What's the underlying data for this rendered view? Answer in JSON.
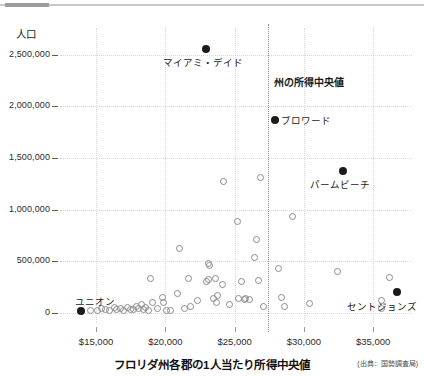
{
  "figure": {
    "y_axis_title": "人口",
    "x_axis_title": "フロリダ州各郡の1人当たり所得中央値",
    "source_note": "(出典：国勢調査局)"
  },
  "annotations": {
    "miami_dade": "マイアミ・デイド",
    "state_median": "州の所得中央値",
    "broward": "ブロワード",
    "palm_beach": "パームビーチ",
    "union": "ユニオン",
    "st_johns": "セントジョンズ"
  },
  "chart_data": {
    "type": "scatter",
    "title": "",
    "xlabel": "フロリダ州各郡の1人当たり所得中央値",
    "ylabel": "人口",
    "xlim": [
      12400,
      37800
    ],
    "ylim": [
      -90000,
      2760000
    ],
    "xticks": [
      15000,
      20000,
      25000,
      30000,
      35000
    ],
    "xticklabels": [
      "$15,000",
      "$20,000",
      "$25,000",
      "$30,000",
      "$35,000"
    ],
    "yticks": [
      0,
      500000,
      1000000,
      1500000,
      2000000,
      2500000
    ],
    "yticklabels": [
      "0",
      "500,000",
      "1,000,000",
      "1,500,000",
      "2,000,000",
      "2,500,000"
    ],
    "grid": true,
    "legend": "none",
    "reference_line": {
      "orientation": "vertical",
      "value": 27400,
      "label": "州の所得中央値",
      "style": "dotted"
    },
    "series": [
      {
        "name": "highlighted-counties",
        "marker": "filled-circle",
        "color": "#1a1a1a",
        "points": [
          {
            "label": "マイアミ・デイド",
            "x": 22900,
            "y": 2560000
          },
          {
            "label": "ブロワード",
            "x": 27900,
            "y": 1870000
          },
          {
            "label": "パームビーチ",
            "x": 32800,
            "y": 1370000
          },
          {
            "label": "セントジョンズ",
            "x": 36700,
            "y": 200000
          },
          {
            "label": "ユニオン",
            "x": 13900,
            "y": 15000
          }
        ]
      },
      {
        "name": "other-counties",
        "marker": "open-circle",
        "color": "#8d8d8d",
        "points": [
          {
            "x": 14600,
            "y": 20000
          },
          {
            "x": 15100,
            "y": 25000
          },
          {
            "x": 15400,
            "y": 45000
          },
          {
            "x": 15700,
            "y": 30000
          },
          {
            "x": 16000,
            "y": 20000
          },
          {
            "x": 16300,
            "y": 50000
          },
          {
            "x": 16500,
            "y": 28000
          },
          {
            "x": 16800,
            "y": 45000
          },
          {
            "x": 17000,
            "y": 22000
          },
          {
            "x": 17300,
            "y": 55000
          },
          {
            "x": 17500,
            "y": 35000
          },
          {
            "x": 17700,
            "y": 28000
          },
          {
            "x": 17900,
            "y": 60000
          },
          {
            "x": 18100,
            "y": 40000
          },
          {
            "x": 18300,
            "y": 75000
          },
          {
            "x": 18450,
            "y": 30000
          },
          {
            "x": 18600,
            "y": 50000
          },
          {
            "x": 18800,
            "y": 22000
          },
          {
            "x": 18950,
            "y": 330000
          },
          {
            "x": 19100,
            "y": 100000
          },
          {
            "x": 19400,
            "y": 40000
          },
          {
            "x": 19800,
            "y": 150000
          },
          {
            "x": 19900,
            "y": 95000
          },
          {
            "x": 20100,
            "y": 20000
          },
          {
            "x": 20400,
            "y": 25000
          },
          {
            "x": 20900,
            "y": 190000
          },
          {
            "x": 21000,
            "y": 620000
          },
          {
            "x": 21400,
            "y": 45000
          },
          {
            "x": 21800,
            "y": 60000
          },
          {
            "x": 21700,
            "y": 330000
          },
          {
            "x": 22300,
            "y": 120000
          },
          {
            "x": 23000,
            "y": 300000
          },
          {
            "x": 23100,
            "y": 320000
          },
          {
            "x": 23150,
            "y": 480000
          },
          {
            "x": 23200,
            "y": 460000
          },
          {
            "x": 23500,
            "y": 140000
          },
          {
            "x": 23600,
            "y": 330000
          },
          {
            "x": 23700,
            "y": 95000
          },
          {
            "x": 23800,
            "y": 170000
          },
          {
            "x": 24100,
            "y": 270000
          },
          {
            "x": 24200,
            "y": 1270000
          },
          {
            "x": 24600,
            "y": 80000
          },
          {
            "x": 25200,
            "y": 880000
          },
          {
            "x": 25300,
            "y": 140000
          },
          {
            "x": 25500,
            "y": 300000
          },
          {
            "x": 25700,
            "y": 130000
          },
          {
            "x": 25800,
            "y": 135000
          },
          {
            "x": 26100,
            "y": 125000
          },
          {
            "x": 26400,
            "y": 535000
          },
          {
            "x": 26600,
            "y": 705000
          },
          {
            "x": 26700,
            "y": 310000
          },
          {
            "x": 26900,
            "y": 1310000
          },
          {
            "x": 27100,
            "y": 65000
          },
          {
            "x": 28200,
            "y": 430000
          },
          {
            "x": 28400,
            "y": 150000
          },
          {
            "x": 28600,
            "y": 60000
          },
          {
            "x": 29200,
            "y": 935000
          },
          {
            "x": 30400,
            "y": 90000
          },
          {
            "x": 32400,
            "y": 400000
          },
          {
            "x": 35600,
            "y": 120000
          },
          {
            "x": 35600,
            "y": 45000
          },
          {
            "x": 36200,
            "y": 340000
          }
        ]
      }
    ]
  }
}
